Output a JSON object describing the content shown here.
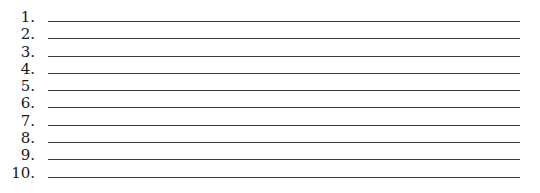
{
  "list": {
    "items": [
      {
        "number": "1."
      },
      {
        "number": "2."
      },
      {
        "number": "3."
      },
      {
        "number": "4."
      },
      {
        "number": "5."
      },
      {
        "number": "6."
      },
      {
        "number": "7."
      },
      {
        "number": "8."
      },
      {
        "number": "9."
      },
      {
        "number": "10."
      }
    ]
  },
  "colors": {
    "line": "#3a3a3a",
    "text": "#1a1a1a",
    "background": "#ffffff"
  }
}
